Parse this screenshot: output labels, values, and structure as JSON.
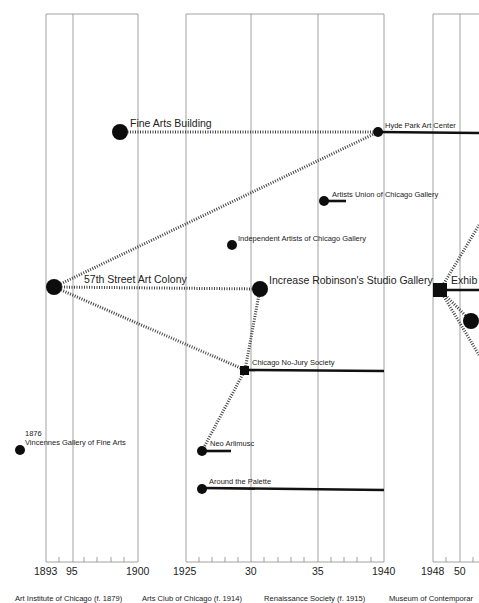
{
  "diagram": {
    "panels": [
      {
        "id": "art-institute",
        "x0": 46,
        "x1": 138,
        "years": [
          "1893",
          "95",
          "1900"
        ],
        "caption": "Art Institute of Chicago (f. 1879)"
      },
      {
        "id": "arts-club",
        "x0": 186,
        "x1": 384,
        "years": [
          "1925",
          "30",
          "35",
          "1940"
        ],
        "caption": "Arts Club of Chicago (f. 1914)"
      },
      {
        "id": "renaissance",
        "caption": "Renaissance Society (f. 1915)"
      },
      {
        "id": "mca",
        "x0": 433,
        "years": [
          "1948",
          "50"
        ],
        "caption": "Museum of Contemporar"
      }
    ],
    "nodes": [
      {
        "id": "fine-arts-building",
        "label": "Fine Arts Building",
        "size": "large"
      },
      {
        "id": "hyde-park-art-center",
        "label": "Hyde Park Art Center",
        "size": "small"
      },
      {
        "id": "artists-union",
        "label": "Artists Union of Chicago Gallery",
        "size": "small"
      },
      {
        "id": "independent-artists",
        "label": "Independent Artists of Chicago Gallery",
        "size": "small"
      },
      {
        "id": "57th-street",
        "label": "57th Street Art Colony",
        "size": "large"
      },
      {
        "id": "increase-robinson",
        "label": "Increase Robinson's Studio Gallery",
        "size": "large"
      },
      {
        "id": "exhib",
        "label": "Exhib",
        "size": "square-large"
      },
      {
        "id": "chicago-no-jury",
        "label": "Chicago No-Jury Society",
        "size": "square-small"
      },
      {
        "id": "vincennes",
        "label": "Vincennes Gallery of Fine Arts",
        "year_note": "1876",
        "size": "small"
      },
      {
        "id": "neo-arlimusc",
        "label": "Neo Arlimusc",
        "size": "small"
      },
      {
        "id": "around-the-palette",
        "label": "Around the Palette",
        "size": "small"
      }
    ]
  }
}
